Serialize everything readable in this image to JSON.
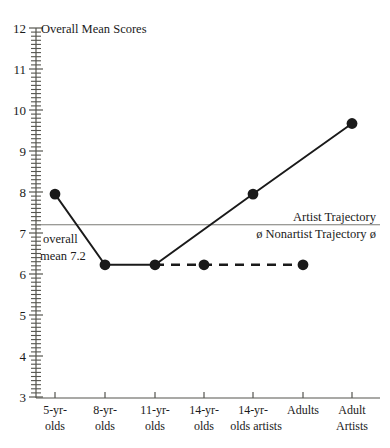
{
  "chart_data": {
    "type": "line",
    "title": "Overall Mean Scores",
    "xlabel": "",
    "ylabel": "",
    "ylim": [
      3,
      12
    ],
    "yticks": [
      3,
      4,
      5,
      6,
      7,
      8,
      9,
      10,
      11,
      12
    ],
    "ytick_labels": [
      "3",
      "4",
      "5",
      "6",
      "7",
      "8",
      "9",
      "10",
      "11",
      "12"
    ],
    "minor_ticks_per_unit": 10,
    "grid": false,
    "legend_position": "inline-right",
    "categories": [
      "5-yr-olds",
      "8-yr-olds",
      "11-yr-olds",
      "14-yr-olds",
      "14-yr-olds artists",
      "Adults",
      "Adult Artists"
    ],
    "category_lines": [
      [
        "5-yr-",
        "olds"
      ],
      [
        "8-yr-",
        "olds"
      ],
      [
        "11-yr-",
        "olds"
      ],
      [
        "14-yr-",
        "olds"
      ],
      [
        "14-yr-",
        "olds artists"
      ],
      [
        "Adults",
        ""
      ],
      [
        "Adult",
        "Artists"
      ]
    ],
    "series": [
      {
        "name": "Artist Trajectory",
        "style": "solid",
        "points": [
          {
            "category": "5-yr-olds",
            "value": 7.95
          },
          {
            "category": "8-yr-olds",
            "value": 6.25
          },
          {
            "category": "11-yr-olds",
            "value": 6.25
          },
          {
            "category": "14-yr-olds artists",
            "value": 7.95
          },
          {
            "category": "Adult Artists",
            "value": 9.5
          }
        ]
      },
      {
        "name": "ø Nonartist Trajectory ø",
        "style": "dashed",
        "points": [
          {
            "category": "11-yr-olds",
            "value": 6.25
          },
          {
            "category": "14-yr-olds",
            "value": 6.25
          },
          {
            "category": "Adults",
            "value": 6.25
          }
        ]
      }
    ],
    "reference_line": {
      "value": 7.2,
      "label_line1": "overall",
      "label_line2": "mean 7.2"
    },
    "annotations": [
      {
        "text": "Artist Trajectory",
        "position": "above-reference-line-right"
      },
      {
        "text": "ø Nonartist Trajectory ø",
        "position": "below-reference-line-right"
      },
      {
        "text": "overall",
        "position": "below-reference-line-left"
      },
      {
        "text": "mean 7.2",
        "position": "below-reference-line-left"
      }
    ]
  },
  "labels": {
    "title": "Overall Mean Scores",
    "y_ticks": {
      "t12": "12",
      "t11": "11",
      "t10": "10",
      "t9": "9",
      "t8": "8",
      "t7": "7",
      "t6": "6",
      "t5": "5",
      "t4": "4",
      "t3": "3"
    },
    "x_ticks": {
      "c0l1": "5-yr-",
      "c0l2": "olds",
      "c1l1": "8-yr-",
      "c1l2": "olds",
      "c2l1": "11-yr-",
      "c2l2": "olds",
      "c3l1": "14-yr-",
      "c3l2": "olds",
      "c4l1": "14-yr-",
      "c4l2": "olds artists",
      "c5l1": "Adults",
      "c6l1": "Adult",
      "c6l2": "Artists"
    },
    "annotations": {
      "artist_trajectory": "Artist Trajectory",
      "nonartist_trajectory": "ø Nonartist Trajectory ø",
      "overall": "overall",
      "mean_value": "mean 7.2"
    }
  },
  "colors": {
    "line": "#1a1a1a",
    "axis": "#55554f",
    "reference_line": "#7a7a74",
    "background": "#ffffff"
  }
}
